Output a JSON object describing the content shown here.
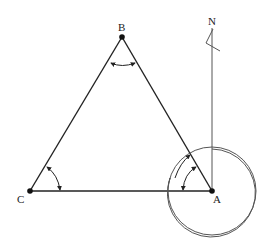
{
  "diagram": {
    "type": "survey-traverse-triangle",
    "colors": {
      "stroke": "#222222",
      "thin_stroke": "#555555",
      "background": "#ffffff"
    },
    "points": [
      {
        "id": "B",
        "label": "B",
        "x": 122,
        "y": 37
      },
      {
        "id": "C",
        "label": "C",
        "x": 30,
        "y": 191
      },
      {
        "id": "A",
        "label": "A",
        "x": 212,
        "y": 191
      }
    ],
    "north": {
      "label": "N"
    },
    "angle_marks": [
      {
        "vertex": "B",
        "description": "interior angle at B"
      },
      {
        "vertex": "C",
        "description": "interior angle at C"
      },
      {
        "vertex": "A",
        "description": "interior angle at A (two arcs)"
      },
      {
        "vertex": "A",
        "description": "bearing circle from north at A"
      }
    ]
  }
}
